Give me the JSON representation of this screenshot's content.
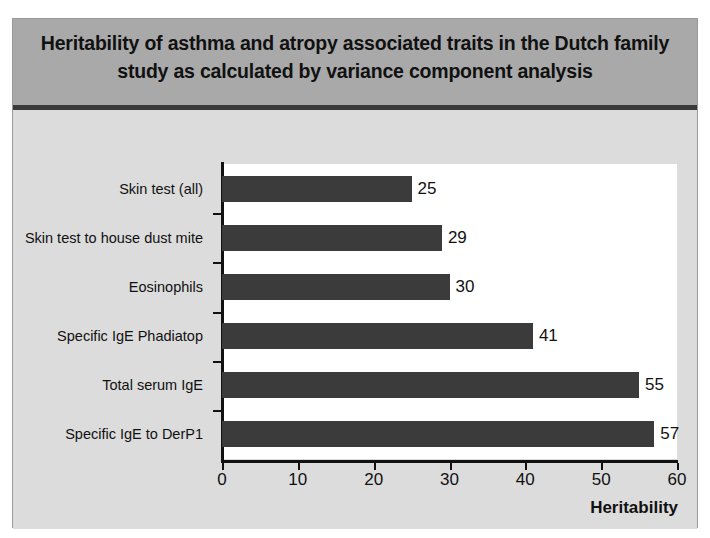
{
  "slide": {
    "title": "Heritability of asthma and atropy associated traits in the Dutch family study as calculated by variance component analysis",
    "background_color": "#dcdcdc",
    "title_band_color": "#a9a9a9"
  },
  "chart_data": {
    "type": "bar",
    "orientation": "horizontal",
    "title": "Heritability of asthma and atropy associated traits in the Dutch family study as calculated by variance component analysis",
    "categories": [
      "Skin test (all)",
      "Skin test to house dust mite",
      "Eosinophils",
      "Specific IgE Phadiatop",
      "Total serum IgE",
      "Specific IgE to DerP1"
    ],
    "values": [
      25,
      29,
      30,
      41,
      55,
      57
    ],
    "value_labels": [
      "25",
      "29",
      "30",
      "41",
      "55",
      "57"
    ],
    "xlabel": "Heritability",
    "ylabel": "",
    "xlim": [
      0,
      60
    ],
    "xticks": [
      0,
      10,
      20,
      30,
      40,
      50,
      60
    ],
    "xtick_labels": [
      "0",
      "10",
      "20",
      "30",
      "40",
      "50",
      "60"
    ],
    "grid": false,
    "legend": false,
    "bar_color": "#3b3b3b",
    "plot_background": "#ffffff"
  }
}
